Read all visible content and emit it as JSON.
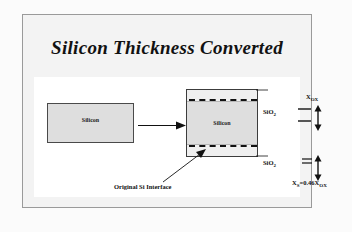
{
  "slide": {
    "title": "Silicon Thickness Converted",
    "left_block_label": "Silicon",
    "right_block_label": "Silicon",
    "oxide_label_top": "SiO",
    "oxide_label_top_sub": "2",
    "oxide_label_bottom": "SiO",
    "oxide_label_bottom_sub": "2",
    "measure_top_label": "X",
    "measure_top_sub": "OX",
    "measure_bottom_label": "X",
    "measure_bottom_sub": "S",
    "measure_bottom_equation": "=0.46X",
    "measure_bottom_equation_sub": "OX",
    "caption": "Original Si Interface",
    "colors": {
      "page_background": "#fbfbfb",
      "frame_background": "#f3f3f3",
      "frame_border": "#9a9a9a",
      "panel_background": "#ffffff",
      "silicon_fill": "#dedede",
      "oxide_fill": "#efefef",
      "block_border": "#3c3c3c",
      "ink": "#111111"
    }
  }
}
